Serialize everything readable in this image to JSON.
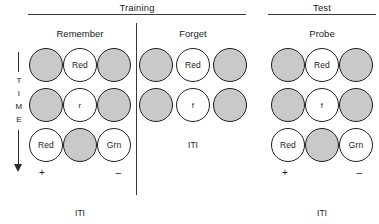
{
  "figure": {
    "time_axis": {
      "name": "TIME",
      "letters": [
        "T",
        "I",
        "M",
        "E"
      ],
      "direction": "downward-arrow"
    },
    "phases": [
      {
        "id": "training",
        "label": "Training"
      },
      {
        "id": "test",
        "label": "Test"
      }
    ],
    "conditions": [
      {
        "id": "remember",
        "phase": "training",
        "title": "Remember",
        "rows": [
          {
            "id": "remember-row-1",
            "type": "stimuli",
            "circles": [
              {
                "fill": "gray",
                "label": ""
              },
              {
                "fill": "white",
                "label": "Red"
              },
              {
                "fill": "gray",
                "label": ""
              }
            ]
          },
          {
            "id": "remember-row-2",
            "type": "stimuli",
            "circles": [
              {
                "fill": "gray",
                "label": ""
              },
              {
                "fill": "white",
                "label": "r"
              },
              {
                "fill": "gray",
                "label": ""
              }
            ]
          },
          {
            "id": "remember-row-3",
            "type": "stimuli",
            "circles": [
              {
                "fill": "white",
                "label": "Red"
              },
              {
                "fill": "gray",
                "label": ""
              },
              {
                "fill": "white",
                "label": "Grn"
              }
            ]
          }
        ],
        "signs": {
          "left": "+",
          "right": "–"
        },
        "iti": "ITI"
      },
      {
        "id": "forget",
        "phase": "training",
        "title": "Forget",
        "rows": [
          {
            "id": "forget-row-1",
            "type": "stimuli",
            "circles": [
              {
                "fill": "gray",
                "label": ""
              },
              {
                "fill": "white",
                "label": "Red"
              },
              {
                "fill": "gray",
                "label": ""
              }
            ]
          },
          {
            "id": "forget-row-2",
            "type": "stimuli",
            "circles": [
              {
                "fill": "gray",
                "label": ""
              },
              {
                "fill": "white",
                "label": "f"
              },
              {
                "fill": "gray",
                "label": ""
              }
            ]
          },
          {
            "id": "forget-row-3",
            "type": "iti",
            "label": "ITI"
          }
        ],
        "signs": null,
        "iti": null
      },
      {
        "id": "probe",
        "phase": "test",
        "title": "Probe",
        "rows": [
          {
            "id": "probe-row-1",
            "type": "stimuli",
            "circles": [
              {
                "fill": "gray",
                "label": ""
              },
              {
                "fill": "white",
                "label": "Red"
              },
              {
                "fill": "gray",
                "label": ""
              }
            ]
          },
          {
            "id": "probe-row-2",
            "type": "stimuli",
            "circles": [
              {
                "fill": "gray",
                "label": ""
              },
              {
                "fill": "white",
                "label": "f"
              },
              {
                "fill": "gray",
                "label": ""
              }
            ]
          },
          {
            "id": "probe-row-3",
            "type": "stimuli",
            "circles": [
              {
                "fill": "white",
                "label": "Red"
              },
              {
                "fill": "gray",
                "label": ""
              },
              {
                "fill": "white",
                "label": "Grn"
              }
            ]
          }
        ],
        "signs": {
          "left": "+",
          "right": "–"
        },
        "iti": "ITI"
      }
    ],
    "colors": {
      "circle_fill_gray": "#c9c9c9",
      "circle_fill_white": "#ffffff",
      "stroke": "#1f1f1f",
      "rule": "#3a3a3a",
      "text": "#1a1a1a",
      "background": "#ffffff"
    }
  }
}
